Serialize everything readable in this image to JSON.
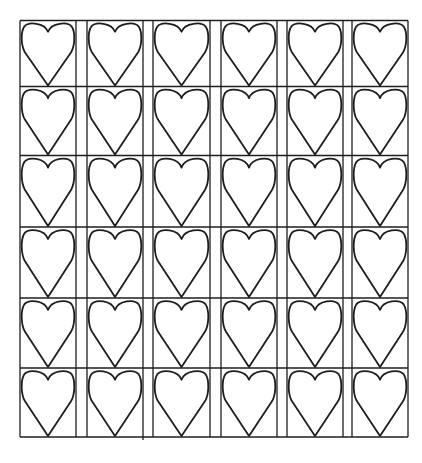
{
  "page": {
    "background": "#ffffff",
    "ink": "#1e1e1e"
  },
  "grid": {
    "rows": 6,
    "columns": 6,
    "left": 20,
    "top": 20.5,
    "right": 408,
    "bottom": 437,
    "row_lines": [
      20.5,
      86.5,
      155.5,
      227,
      298,
      368,
      437
    ],
    "column_cells": [
      {
        "left": 20,
        "right": 76
      },
      {
        "left": 87,
        "right": 143
      },
      {
        "left": 153,
        "right": 210
      },
      {
        "left": 221,
        "right": 277
      },
      {
        "left": 287,
        "right": 343
      },
      {
        "left": 352,
        "right": 408
      }
    ],
    "stray_tick": {
      "x": 143,
      "y1": 437,
      "y2": 440
    },
    "cell_content_icon": "heart-outline-icon",
    "total_hearts": 36
  }
}
